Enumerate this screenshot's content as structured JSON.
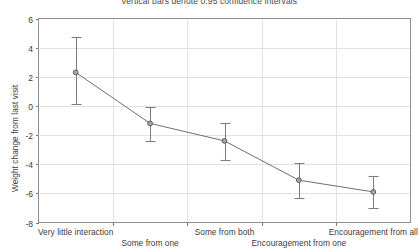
{
  "chart_data": {
    "type": "line",
    "title": "Vertical bars denote 0.95 confidence intervals",
    "xlabel": "",
    "ylabel": "Weight change from last visit",
    "categories": [
      "Very little interaction",
      "Some from one",
      "Some from both",
      "Encouragement from one",
      "Encouragement from all"
    ],
    "values": [
      2.3,
      -1.2,
      -2.4,
      -5.1,
      -5.9
    ],
    "ci_lower": [
      0.1,
      -2.4,
      -3.7,
      -6.3,
      -7.0
    ],
    "ci_upper": [
      4.7,
      -0.1,
      -1.2,
      -3.9,
      -4.8
    ],
    "ylim": [
      -8,
      6
    ],
    "yticks": [
      6,
      4,
      2,
      0,
      -2,
      -4,
      -6,
      -8
    ],
    "ytick_labels": [
      "6",
      "4",
      "2",
      "0",
      "-2",
      "-4",
      "-6",
      "-8"
    ],
    "grid": true,
    "legend": false,
    "marker": "circle",
    "series_color": "#6f6f6f",
    "marker_fill": "#a6a6a6",
    "grid_color": "#e2e2e2",
    "frame_color": "#8d8d8d",
    "background": "#ffffff"
  }
}
